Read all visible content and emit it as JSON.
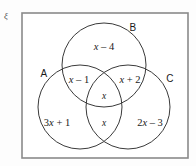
{
  "diagram": {
    "type": "venn-three-set",
    "universal_set_symbol": "ξ",
    "set_labels": [
      {
        "name": "A",
        "text": "A",
        "x": 44,
        "y": 74
      },
      {
        "name": "B",
        "text": "B",
        "x": 133,
        "y": 28
      },
      {
        "name": "C",
        "text": "C",
        "x": 170,
        "y": 79
      }
    ],
    "region_labels": [
      {
        "name": "b-only",
        "text": "x – 4",
        "x": 104,
        "y": 47,
        "size": "normal"
      },
      {
        "name": "a-and-b",
        "text": "x – 1",
        "x": 79,
        "y": 80,
        "size": "normal"
      },
      {
        "name": "b-and-c",
        "text": "x + 2",
        "x": 130,
        "y": 80,
        "size": "normal"
      },
      {
        "name": "a-b-c",
        "text": "x",
        "x": 104,
        "y": 97,
        "size": "small"
      },
      {
        "name": "a-and-c",
        "text": "x",
        "x": 104,
        "y": 124,
        "size": "small"
      },
      {
        "name": "a-only",
        "text": "3x + 1",
        "x": 57,
        "y": 123,
        "size": "normal"
      },
      {
        "name": "c-only",
        "text": "2x – 3",
        "x": 150,
        "y": 123,
        "size": "normal"
      }
    ],
    "geometry": {
      "rect": {
        "x": 22,
        "y": 13,
        "width": 166,
        "height": 145
      },
      "circles": [
        {
          "name": "circle-b",
          "cx": 104,
          "cy": 65,
          "r": 42
        },
        {
          "name": "circle-a",
          "cx": 80,
          "cy": 107,
          "r": 42
        },
        {
          "name": "circle-c",
          "cx": 128,
          "cy": 107,
          "r": 42
        }
      ]
    },
    "colors": {
      "rect_stroke": "#8a8a8a",
      "circle_stroke": "#3a3a3a",
      "text": "#1a1a1a",
      "background": "#fdfdfd"
    }
  }
}
